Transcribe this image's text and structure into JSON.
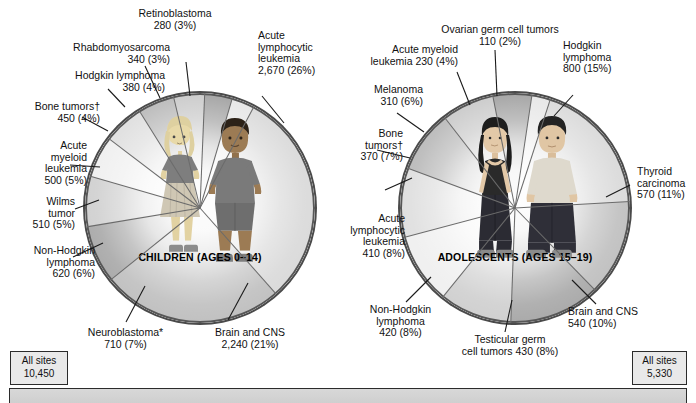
{
  "figure": {
    "left_panel": {
      "caption": "CHILDREN (AGES 0–14)",
      "all_sites_label": "All sites",
      "all_sites_value": "10,450"
    },
    "right_panel": {
      "caption": "ADOLESCENTS (AGES 15–19)",
      "all_sites_label": "All sites",
      "all_sites_value": "5,330"
    }
  },
  "chart_data": [
    {
      "type": "pie",
      "title": "CHILDREN (AGES 0–14)",
      "total_label": "All sites",
      "total": 10450,
      "value_unit": "cases",
      "legend": "labels-with-leader-lines",
      "grid": false,
      "categories": [
        "Acute lymphocytic leukemia",
        "Brain and CNS",
        "Neuroblastoma*",
        "Non-Hodgkin lymphoma",
        "Wilms tumor",
        "Acute myeloid leukemia",
        "Bone tumors†",
        "Hodgkin lymphoma",
        "Rhabdomyosarcoma",
        "Retinoblastoma"
      ],
      "values": [
        2670,
        2240,
        710,
        620,
        510,
        500,
        450,
        380,
        340,
        280
      ],
      "percents": [
        26,
        21,
        7,
        6,
        5,
        5,
        4,
        4,
        3,
        3
      ],
      "labels": [
        {
          "name": "Acute lymphocytic leukemia",
          "text": "Acute\nlymphocytic\nleukemia\n2,670 (26%)",
          "value": 2670,
          "percent": 26
        },
        {
          "name": "Brain and CNS",
          "text": "Brain and CNS\n2,240 (21%)",
          "value": 2240,
          "percent": 21
        },
        {
          "name": "Neuroblastoma*",
          "text": "Neuroblastoma*\n710 (7%)",
          "value": 710,
          "percent": 7
        },
        {
          "name": "Non-Hodgkin lymphoma",
          "text": "Non-Hodgkin\nlymphoma\n620 (6%)",
          "value": 620,
          "percent": 6
        },
        {
          "name": "Wilms tumor",
          "text": "Wilms\ntumor\n510 (5%)",
          "value": 510,
          "percent": 5
        },
        {
          "name": "Acute myeloid leukemia",
          "text": "Acute\nmyeloid\nleukemia\n500 (5%)",
          "value": 500,
          "percent": 5
        },
        {
          "name": "Bone tumors†",
          "text": "Bone tumors†\n450 (4%)",
          "value": 450,
          "percent": 4
        },
        {
          "name": "Hodgkin lymphoma",
          "text": "Hodgkin lymphoma\n380 (4%)",
          "value": 380,
          "percent": 4
        },
        {
          "name": "Rhabdomyosarcoma",
          "text": "Rhabdomyosarcoma\n340 (3%)",
          "value": 340,
          "percent": 3
        },
        {
          "name": "Retinoblastoma",
          "text": "Retinoblastoma\n280 (3%)",
          "value": 280,
          "percent": 3
        }
      ]
    },
    {
      "type": "pie",
      "title": "ADOLESCENTS (AGES 15–19)",
      "total_label": "All sites",
      "total": 5330,
      "value_unit": "cases",
      "legend": "labels-with-leader-lines",
      "grid": false,
      "categories": [
        "Hodgkin lymphoma",
        "Thyroid carcinoma",
        "Brain and CNS",
        "Testicular germ cell tumors",
        "Non-Hodgkin lymphoma",
        "Acute lymphocytic leukemia",
        "Bone tumors†",
        "Melanoma",
        "Acute myeloid leukemia",
        "Ovarian germ cell tumors"
      ],
      "values": [
        800,
        570,
        540,
        430,
        420,
        410,
        370,
        310,
        230,
        110
      ],
      "percents": [
        15,
        11,
        10,
        8,
        8,
        8,
        7,
        6,
        4,
        2
      ],
      "labels": [
        {
          "name": "Hodgkin lymphoma",
          "text": "Hodgkin\nlymphoma\n800 (15%)",
          "value": 800,
          "percent": 15
        },
        {
          "name": "Thyroid carcinoma",
          "text": "Thyroid\ncarcinoma\n570 (11%)",
          "value": 570,
          "percent": 11
        },
        {
          "name": "Brain and CNS",
          "text": "Brain and CNS\n540 (10%)",
          "value": 540,
          "percent": 10
        },
        {
          "name": "Testicular germ cell tumors",
          "text": "Testicular germ\ncell tumors 430 (8%)",
          "value": 430,
          "percent": 8
        },
        {
          "name": "Non-Hodgkin lymphoma",
          "text": "Non-Hodgkin\nlymphoma\n420 (8%)",
          "value": 420,
          "percent": 8
        },
        {
          "name": "Acute lymphocytic leukemia",
          "text": "Acute\nlymphocytic\nleukemia\n410 (8%)",
          "value": 410,
          "percent": 8
        },
        {
          "name": "Bone tumors†",
          "text": "Bone\ntumors†\n370 (7%)",
          "value": 370,
          "percent": 7
        },
        {
          "name": "Melanoma",
          "text": "Melanoma\n310 (6%)",
          "value": 310,
          "percent": 6
        },
        {
          "name": "Acute myeloid leukemia",
          "text": "Acute myeloid\nleukemia 230 (4%)",
          "value": 230,
          "percent": 4
        },
        {
          "name": "Ovarian germ cell tumors",
          "text": "Ovarian germ cell tumors\n110 (2%)",
          "value": 110,
          "percent": 2
        }
      ]
    }
  ]
}
